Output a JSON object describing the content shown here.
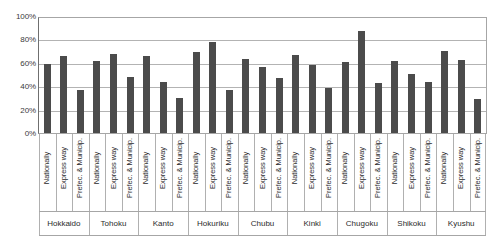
{
  "chart_data": {
    "type": "bar",
    "title": "",
    "xlabel": "",
    "ylabel": "",
    "ylim": [
      0,
      100
    ],
    "grid": true,
    "legend": "none",
    "bar_color": "#4b4b4b",
    "gridline_color": "#b3b3b3",
    "y_ticks": [
      "0%",
      "20%",
      "40%",
      "60%",
      "80%",
      "100%"
    ],
    "y_tick_values": [
      0,
      20,
      40,
      60,
      80,
      100
    ],
    "series_labels": [
      "Nationally",
      "Express way",
      "Prefec. & Municip."
    ],
    "categories": [
      "Hokkaido",
      "Tohoku",
      "Kanto",
      "Hokuriku",
      "Chubu",
      "Kinki",
      "Chugoku",
      "Shikoku",
      "Kyushu"
    ],
    "series": [
      {
        "name": "Nationally",
        "values": [
          60,
          62.5,
          67,
          70.5,
          64.5,
          68,
          62,
          63,
          71
        ]
      },
      {
        "name": "Express way",
        "values": [
          67,
          68.5,
          44.5,
          79.5,
          57.5,
          59,
          88.5,
          51,
          63.5
        ]
      },
      {
        "name": "Prefec. & Municip.",
        "values": [
          37.5,
          49,
          30.5,
          37.5,
          48,
          39.5,
          43.5,
          44,
          30
        ]
      }
    ],
    "groups": [
      {
        "region": "Hokkaido",
        "bars": [
          {
            "label": "Nationally",
            "value": 60
          },
          {
            "label": "Express way",
            "value": 67
          },
          {
            "label": "Prefec. & Municip.",
            "value": 37.5
          }
        ]
      },
      {
        "region": "Tohoku",
        "bars": [
          {
            "label": "Nationally",
            "value": 62.5
          },
          {
            "label": "Express way",
            "value": 68.5
          },
          {
            "label": "Prefec. & Municip.",
            "value": 49
          }
        ]
      },
      {
        "region": "Kanto",
        "bars": [
          {
            "label": "Nationally",
            "value": 67
          },
          {
            "label": "Express way",
            "value": 44.5
          },
          {
            "label": "Prefec. & Municip.",
            "value": 30.5
          }
        ]
      },
      {
        "region": "Hokuriku",
        "bars": [
          {
            "label": "Nationally",
            "value": 70.5
          },
          {
            "label": "Express way",
            "value": 79.5
          },
          {
            "label": "Prefec. & Municip.",
            "value": 37.5
          }
        ]
      },
      {
        "region": "Chubu",
        "bars": [
          {
            "label": "Nationally",
            "value": 64.5
          },
          {
            "label": "Express way",
            "value": 57.5
          },
          {
            "label": "Prefec. & Municip.",
            "value": 48
          }
        ]
      },
      {
        "region": "Kinki",
        "bars": [
          {
            "label": "Nationally",
            "value": 68
          },
          {
            "label": "Express way",
            "value": 59
          },
          {
            "label": "Prefec. & Municip.",
            "value": 39.5
          }
        ]
      },
      {
        "region": "Chugoku",
        "bars": [
          {
            "label": "Nationally",
            "value": 62
          },
          {
            "label": "Express way",
            "value": 88.5
          },
          {
            "label": "Prefec. & Municip.",
            "value": 43.5
          }
        ]
      },
      {
        "region": "Shikoku",
        "bars": [
          {
            "label": "Nationally",
            "value": 63
          },
          {
            "label": "Express way",
            "value": 51
          },
          {
            "label": "Prefec. & Municip.",
            "value": 44
          }
        ]
      },
      {
        "region": "Kyushu",
        "bars": [
          {
            "label": "Nationally",
            "value": 71
          },
          {
            "label": "Express way",
            "value": 63.5
          },
          {
            "label": "Prefec. & Municip.",
            "value": 30
          }
        ]
      }
    ]
  }
}
